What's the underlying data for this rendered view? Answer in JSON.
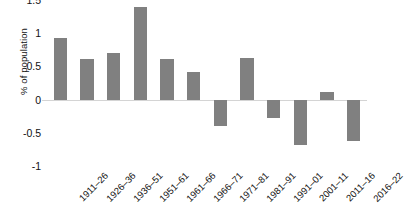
{
  "chart_data": {
    "type": "bar",
    "title": "",
    "xlabel": "",
    "ylabel": "% of population",
    "categories": [
      "1911–26",
      "1926–36",
      "1936–51",
      "1951–61",
      "1961–66",
      "1966–71",
      "1971–81",
      "1981–91",
      "1991–01",
      "2001–11",
      "2011–16",
      "2016–22"
    ],
    "values": [
      0.93,
      0.61,
      0.7,
      1.4,
      0.61,
      0.41,
      -0.4,
      0.62,
      -0.28,
      -0.68,
      0.12,
      -0.63
    ],
    "ylim": [
      -1,
      1.5
    ],
    "ytick_labels": [
      "1.5",
      "1",
      "0.5",
      "0",
      "-0.5",
      "-1"
    ],
    "ytick_values": [
      1.5,
      1,
      0.5,
      0,
      -0.5,
      -1
    ],
    "grid": false,
    "legend": false,
    "bar_color": "#808080",
    "axis_color": "#d4d4d4",
    "text_color": "#111111"
  }
}
